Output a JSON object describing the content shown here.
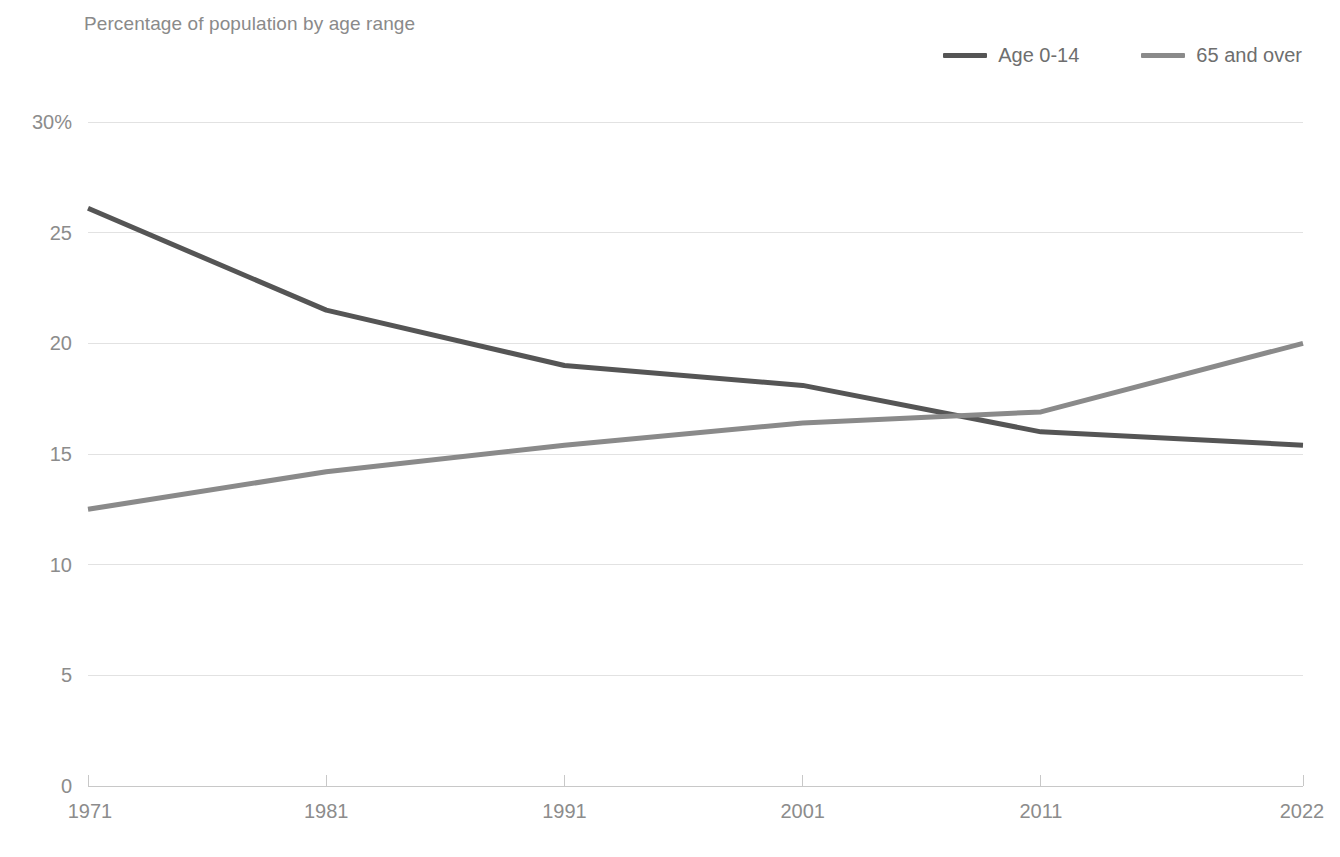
{
  "chart_data": {
    "type": "line",
    "title": "Percentage of population by age range",
    "xlabel": "",
    "ylabel": "",
    "x": [
      1971,
      1981,
      1991,
      2001,
      2011,
      2022
    ],
    "xtick_labels": [
      "1971",
      "1981",
      "1991",
      "2001",
      "2011",
      "2022"
    ],
    "ytick_labels": [
      "30%",
      "25",
      "20",
      "15",
      "10",
      "5",
      "0"
    ],
    "ytick_values": [
      30,
      25,
      20,
      15,
      10,
      5,
      0
    ],
    "ylim": [
      0,
      30
    ],
    "xlim": [
      1971,
      2022
    ],
    "grid": "horizontal",
    "legend_position": "top-right",
    "series": [
      {
        "name": "Age 0-14",
        "color": "#555555",
        "values": [
          26.1,
          21.5,
          19.0,
          18.1,
          16.0,
          15.4
        ]
      },
      {
        "name": "65 and over",
        "color": "#8a8a8a",
        "values": [
          12.5,
          14.2,
          15.4,
          16.4,
          16.9,
          20.0
        ]
      }
    ]
  },
  "colors": {
    "grid": "#e2e2e2",
    "axis": "#c8c8c8",
    "tick_text": "#8c8c8c",
    "title_text": "#8a8a8a",
    "series_dark": "#555555",
    "series_light": "#8a8a8a"
  }
}
